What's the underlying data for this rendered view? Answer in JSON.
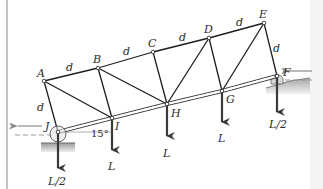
{
  "diagram": {
    "type": "truss",
    "title": "",
    "joints": [
      {
        "id": "A",
        "label": "A",
        "x": 44,
        "y": 81
      },
      {
        "id": "B",
        "label": "B",
        "x": 98,
        "y": 68
      },
      {
        "id": "C",
        "label": "C",
        "x": 153,
        "y": 52
      },
      {
        "id": "D",
        "label": "D",
        "x": 209,
        "y": 38
      },
      {
        "id": "E",
        "label": "E",
        "x": 264,
        "y": 23
      },
      {
        "id": "F",
        "label": "F",
        "x": 277,
        "y": 76
      },
      {
        "id": "G",
        "label": "G",
        "x": 222,
        "y": 91
      },
      {
        "id": "H",
        "label": "H",
        "x": 167,
        "y": 104
      },
      {
        "id": "I",
        "label": "I",
        "x": 112,
        "y": 118
      },
      {
        "id": "J",
        "label": "J",
        "x": 58,
        "y": 132
      }
    ],
    "members": [
      [
        "A",
        "B"
      ],
      [
        "B",
        "C"
      ],
      [
        "C",
        "D"
      ],
      [
        "D",
        "E"
      ],
      [
        "J",
        "I"
      ],
      [
        "I",
        "H"
      ],
      [
        "H",
        "G"
      ],
      [
        "G",
        "F"
      ],
      [
        "A",
        "J"
      ],
      [
        "B",
        "I"
      ],
      [
        "C",
        "H"
      ],
      [
        "D",
        "G"
      ],
      [
        "E",
        "F"
      ],
      [
        "A",
        "I"
      ],
      [
        "B",
        "H"
      ],
      [
        "D",
        "H"
      ],
      [
        "E",
        "G"
      ]
    ],
    "dimension_labels": [
      {
        "text": "d",
        "x": 68,
        "y": 72
      },
      {
        "text": "d",
        "x": 124,
        "y": 55
      },
      {
        "text": "d",
        "x": 180,
        "y": 41
      },
      {
        "text": "d",
        "x": 237,
        "y": 26
      },
      {
        "text": "d",
        "x": 36,
        "y": 110
      },
      {
        "text": "d",
        "x": 274,
        "y": 52
      }
    ],
    "loads": [
      {
        "at": "J",
        "label": "L/2",
        "x": 58,
        "y1": 132,
        "y2": 168,
        "lx": 50,
        "ly": 185
      },
      {
        "at": "I",
        "label": "L",
        "x": 112,
        "y1": 118,
        "y2": 150,
        "lx": 108,
        "ly": 170
      },
      {
        "at": "H",
        "label": "L",
        "x": 167,
        "y1": 104,
        "y2": 136,
        "lx": 163,
        "ly": 156
      },
      {
        "at": "G",
        "label": "L",
        "x": 222,
        "y1": 91,
        "y2": 122,
        "lx": 218,
        "ly": 140
      },
      {
        "at": "F",
        "label": "L/2",
        "x": 277,
        "y1": 76,
        "y2": 112,
        "lx": 268,
        "ly": 129
      }
    ],
    "angle_label": {
      "text": "15°",
      "x": 92,
      "y": 136
    },
    "supports": [
      {
        "at": "J",
        "type": "roller"
      },
      {
        "at": "F",
        "type": "pin-on-slope"
      }
    ],
    "reactions": [
      {
        "at": "J",
        "direction": "left"
      },
      {
        "at": "F",
        "direction": "left"
      }
    ],
    "colors": {
      "member": "#1e1e1e",
      "load_arrow": "#3a3a3a",
      "ground": "#b8b8b8",
      "ghost": "#9a9a9a",
      "label": "#2a2a2a"
    }
  }
}
